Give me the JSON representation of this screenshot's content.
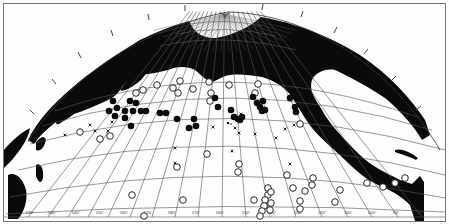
{
  "map": {
    "projection": "polar-conic",
    "region": "North Pacific Ocean",
    "colors": {
      "land": "#0a0a0a",
      "ocean": "#fdfdfd",
      "grid": "#555555",
      "border": "#777777",
      "marker": "#0a0a0a"
    },
    "bottom_longitude_labels": [
      "120°",
      "130°",
      "140°",
      "150°",
      "160°",
      "170°",
      "180°",
      "170°",
      "160°",
      "150°",
      "140°",
      "130°",
      "120°",
      "110°",
      "100°",
      "90°",
      "80°"
    ],
    "left_latitude_labels": [
      "30°",
      "20°",
      "10°"
    ],
    "right_latitude_labels": [
      "30°",
      "20°",
      "10°"
    ],
    "legend_symbols": {
      "filled_circle": "filled circle station",
      "open_circle": "open circle station",
      "cross": "x station"
    }
  },
  "markers": {
    "filled": [
      [
        113,
        101
      ],
      [
        117,
        108
      ],
      [
        109,
        111
      ],
      [
        125,
        111
      ],
      [
        133,
        111
      ],
      [
        141,
        111
      ],
      [
        115,
        116
      ],
      [
        130,
        101
      ],
      [
        131,
        126
      ],
      [
        125,
        118
      ],
      [
        146,
        111
      ],
      [
        160,
        113
      ],
      [
        166,
        113
      ],
      [
        177,
        119
      ],
      [
        194,
        119
      ],
      [
        196,
        126
      ],
      [
        189,
        128
      ],
      [
        215,
        98
      ],
      [
        218,
        107
      ],
      [
        231,
        110
      ],
      [
        234,
        117
      ],
      [
        238,
        119
      ],
      [
        240,
        120
      ],
      [
        242,
        117
      ],
      [
        253,
        97
      ],
      [
        257,
        103
      ],
      [
        260,
        107
      ],
      [
        263,
        101
      ],
      [
        265,
        110
      ],
      [
        262,
        111
      ],
      [
        290,
        98
      ],
      [
        295,
        107
      ],
      [
        296,
        112
      ],
      [
        136,
        103
      ]
    ],
    "open": [
      [
        136,
        93
      ],
      [
        143,
        90
      ],
      [
        157,
        85
      ],
      [
        173,
        88
      ],
      [
        180,
        81
      ],
      [
        178,
        93
      ],
      [
        193,
        89
      ],
      [
        209,
        82
      ],
      [
        211,
        93
      ],
      [
        210,
        101
      ],
      [
        229,
        85
      ],
      [
        258,
        84
      ],
      [
        255,
        93
      ],
      [
        300,
        124
      ],
      [
        80,
        132
      ],
      [
        100,
        139
      ],
      [
        110,
        136
      ],
      [
        207,
        154
      ],
      [
        239,
        164
      ],
      [
        177,
        167
      ],
      [
        132,
        195
      ],
      [
        183,
        200
      ],
      [
        144,
        216
      ],
      [
        238,
        172
      ],
      [
        287,
        175
      ],
      [
        293,
        188
      ],
      [
        313,
        178
      ],
      [
        312,
        185
      ],
      [
        268,
        188
      ],
      [
        268,
        195
      ],
      [
        271,
        192
      ],
      [
        265,
        200
      ],
      [
        264,
        206
      ],
      [
        262,
        211
      ],
      [
        260,
        216
      ],
      [
        271,
        203
      ],
      [
        300,
        201
      ],
      [
        305,
        191
      ],
      [
        340,
        190
      ],
      [
        335,
        202
      ],
      [
        367,
        183
      ],
      [
        383,
        187
      ],
      [
        395,
        183
      ],
      [
        405,
        178
      ],
      [
        270,
        210
      ],
      [
        300,
        209
      ],
      [
        254,
        200
      ]
    ],
    "cross": [
      [
        90,
        125
      ],
      [
        95,
        131
      ],
      [
        108,
        131
      ],
      [
        112,
        122
      ],
      [
        65,
        135
      ],
      [
        175,
        163
      ],
      [
        213,
        127
      ],
      [
        255,
        134
      ],
      [
        285,
        129
      ],
      [
        294,
        125
      ],
      [
        235,
        128
      ],
      [
        239,
        133
      ],
      [
        276,
        138
      ],
      [
        290,
        164
      ],
      [
        175,
        148
      ],
      [
        241,
        114
      ],
      [
        232,
        151
      ]
    ]
  }
}
